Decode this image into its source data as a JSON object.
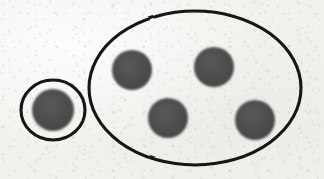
{
  "image": {
    "kind": "hand-drawn-set-diagram",
    "medium_description": "marker drawing on textured paper",
    "width": 324,
    "height": 179
  },
  "palette": {
    "paper_background": "#f2f1ed",
    "outline_stroke": "#141414",
    "dot_fill": "#4d4d4d",
    "dot_edge": "#5a5a5a"
  },
  "canvas": {
    "background_label": "paper-background",
    "texture_label": "paper-speckle-texture"
  },
  "groups": [
    {
      "id": "small-group",
      "label": "small-ellipse-group",
      "shape": "ellipse",
      "cx": 53,
      "cy": 110,
      "rx": 32,
      "ry": 30,
      "stroke_width": 3,
      "stroke_color": "#141414",
      "fill": "none",
      "dot_count": 1
    },
    {
      "id": "large-group",
      "label": "large-ellipse-group",
      "shape": "ellipse",
      "cx": 195,
      "cy": 88,
      "rx": 106,
      "ry": 77,
      "stroke_width": 3,
      "stroke_color": "#141414",
      "fill": "none",
      "dot_count": 4
    }
  ],
  "dots": [
    {
      "id": "dot-1",
      "label": "dot-in-small-group",
      "group": "small-group",
      "cx": 53,
      "cy": 110,
      "r": 21,
      "fill": "#4d4d4d"
    },
    {
      "id": "dot-2",
      "label": "dot-top-left-in-large-group",
      "group": "large-group",
      "cx": 132,
      "cy": 70,
      "r": 20,
      "fill": "#4d4d4d"
    },
    {
      "id": "dot-3",
      "label": "dot-top-right-in-large-group",
      "group": "large-group",
      "cx": 214,
      "cy": 67,
      "r": 20,
      "fill": "#4d4d4d"
    },
    {
      "id": "dot-4",
      "label": "dot-bottom-left-in-large-group",
      "group": "large-group",
      "cx": 168,
      "cy": 118,
      "r": 20,
      "fill": "#4d4d4d"
    },
    {
      "id": "dot-5",
      "label": "dot-bottom-right-in-large-group",
      "group": "large-group",
      "cx": 255,
      "cy": 120,
      "r": 20,
      "fill": "#4d4d4d"
    }
  ],
  "counts": {
    "total_dots": 5,
    "small_group_dots": 1,
    "large_group_dots": 4,
    "total_groups": 2
  },
  "text": {
    "labels": []
  }
}
